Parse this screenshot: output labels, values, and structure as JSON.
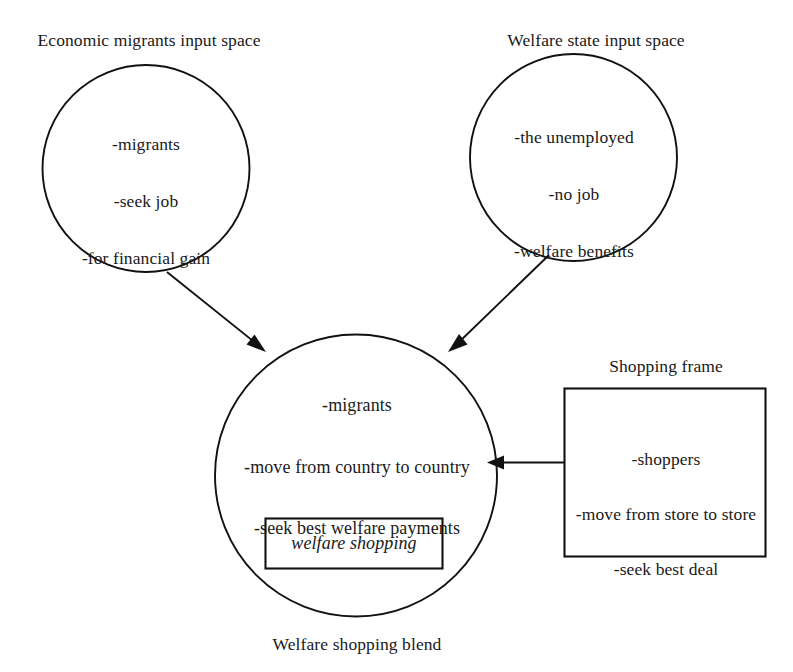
{
  "diagram": {
    "type": "conceptual-blending-network",
    "caption": "Welfare shopping blend",
    "input_space_left": {
      "label": "Economic migrants input space",
      "items": [
        "-migrants",
        "-seek job",
        "-for financial gain"
      ]
    },
    "input_space_right": {
      "label": "Welfare state input space",
      "items": [
        "-the unemployed",
        "-no job",
        "-welfare benefits"
      ]
    },
    "blend_space": {
      "items": [
        "-migrants",
        "-move from country to country",
        "-seek best welfare payments"
      ],
      "emergent_structure": "welfare shopping"
    },
    "frame": {
      "label": "Shopping frame",
      "items": [
        "-shoppers",
        "-move from store to store",
        "-seek best deal"
      ]
    },
    "connections": [
      {
        "from": "Economic migrants input space",
        "to": "Welfare shopping blend",
        "style": "arrow"
      },
      {
        "from": "Welfare state input space",
        "to": "Welfare shopping blend",
        "style": "arrow"
      },
      {
        "from": "Shopping frame",
        "to": "Welfare shopping blend",
        "style": "arrow"
      }
    ],
    "colors": {
      "stroke": "#111111",
      "background": "#ffffff",
      "text": "#1a1a1a"
    }
  }
}
